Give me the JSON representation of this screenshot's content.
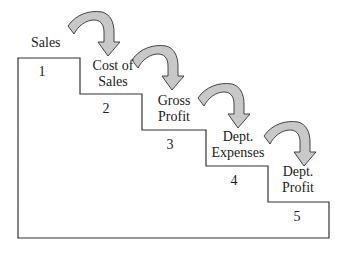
{
  "diagram": {
    "type": "staircase-flow",
    "steps": [
      {
        "number": "1",
        "label": "Sales"
      },
      {
        "number": "2",
        "label": "Cost of Sales"
      },
      {
        "number": "3",
        "label": "Gross Profit"
      },
      {
        "number": "4",
        "label": "Dept. Expenses"
      },
      {
        "number": "5",
        "label": "Dept. Profit"
      }
    ],
    "labels": {
      "sales": "Sales",
      "cost_line1": "Cost of",
      "cost_line2": "Sales",
      "gross_line1": "Gross",
      "gross_line2": "Profit",
      "exp_line1": "Dept.",
      "exp_line2": "Expenses",
      "profit_line1": "Dept.",
      "profit_line2": "Profit"
    },
    "colors": {
      "outline": "#333333",
      "arrow_fill": "#c8c8c8",
      "arrow_stroke": "#333333"
    }
  }
}
